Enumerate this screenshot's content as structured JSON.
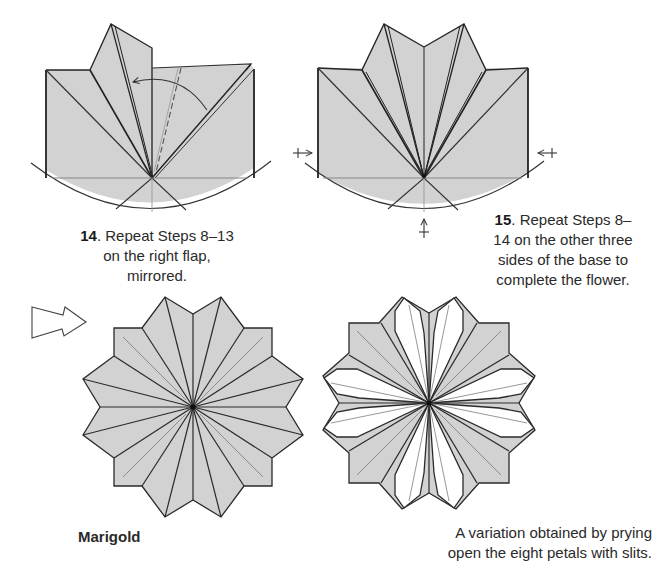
{
  "steps": [
    {
      "number": "14",
      "text": ". Repeat Steps 8–13 on the right flap, mirrored."
    },
    {
      "number": "15",
      "text": ". Repeat Steps 8–14 on the other three sides of the base to complete the flower."
    }
  ],
  "final": {
    "name": "Marigold",
    "variation_caption": "A variation obtained by prying open the eight petals with slits."
  },
  "diagrams": {
    "step14": {
      "icon": "fold-arrow",
      "dashed_line": "valley-fold"
    },
    "step15": {
      "icons": [
        "push-arrow-left",
        "push-arrow-right",
        "push-arrow-bottom"
      ]
    },
    "transition": {
      "icon": "hollow-arrow-right"
    },
    "marigold": {
      "petals": 12,
      "symmetry": "square base with 12 petals"
    },
    "variation": {
      "opened_petals": 8
    }
  },
  "colors": {
    "paper": "#d2d2d2",
    "paper_white": "#ffffff",
    "line": "#2a2a2a",
    "crease": "#8c8c8c"
  }
}
